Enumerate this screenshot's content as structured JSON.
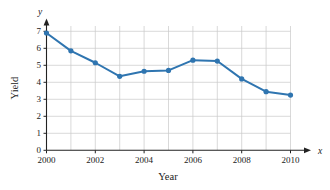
{
  "chart_data": {
    "type": "line",
    "title": "",
    "xlabel": "Year",
    "ylabel": "Yield",
    "x_axis_symbol": "x",
    "y_axis_symbol": "y",
    "x": [
      2000,
      2001,
      2002,
      2003,
      2004,
      2005,
      2006,
      2007,
      2008,
      2009,
      2010
    ],
    "values": [
      6.9,
      5.85,
      5.15,
      4.35,
      4.65,
      4.7,
      5.3,
      5.25,
      4.2,
      3.45,
      3.25
    ],
    "series": [
      {
        "name": "Yield",
        "values": [
          6.9,
          5.85,
          5.15,
          4.35,
          4.65,
          4.7,
          5.3,
          5.25,
          4.2,
          3.45,
          3.25
        ]
      }
    ],
    "xtick_labels": [
      "2000",
      "2002",
      "2004",
      "2006",
      "2008",
      "2010"
    ],
    "xtick_values": [
      2000,
      2002,
      2004,
      2006,
      2008,
      2010
    ],
    "ytick_labels": [
      "0",
      "1",
      "2",
      "3",
      "4",
      "5",
      "6",
      "7"
    ],
    "ytick_values": [
      0,
      1,
      2,
      3,
      4,
      5,
      6,
      7
    ],
    "xlim": [
      2000,
      2010
    ],
    "ylim": [
      0,
      7
    ],
    "grid": true,
    "legend": false,
    "legend_position": "none",
    "marker": "circle",
    "line_color": "#2f75b0",
    "marker_color": "#2f75b0",
    "grid_color": "#c9c9c9",
    "axis_color": "#222222"
  }
}
